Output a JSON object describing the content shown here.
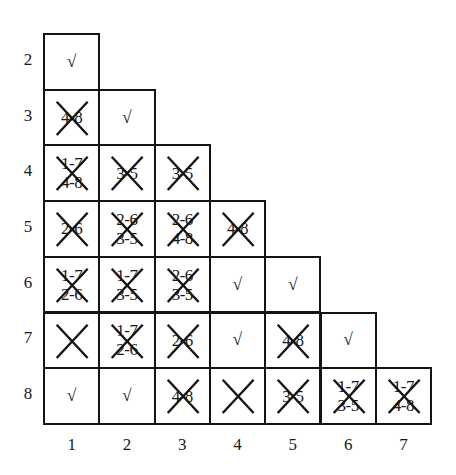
{
  "diagram": {
    "type": "implication-table",
    "row_labels": [
      "2",
      "3",
      "4",
      "5",
      "6",
      "7",
      "8"
    ],
    "col_labels": [
      "1",
      "2",
      "3",
      "4",
      "5",
      "6",
      "7"
    ],
    "rows": [
      {
        "row": "2",
        "cells": [
          {
            "col": "1",
            "mark": "check",
            "pairs": []
          }
        ]
      },
      {
        "row": "3",
        "cells": [
          {
            "col": "1",
            "mark": "crossed",
            "pairs": [
              "4-8"
            ]
          },
          {
            "col": "2",
            "mark": "check",
            "pairs": []
          }
        ]
      },
      {
        "row": "4",
        "cells": [
          {
            "col": "1",
            "mark": "crossed",
            "pairs": [
              "1-7",
              "4-8"
            ]
          },
          {
            "col": "2",
            "mark": "crossed",
            "pairs": [
              "3-5"
            ]
          },
          {
            "col": "3",
            "mark": "crossed",
            "pairs": [
              "3-5"
            ]
          }
        ]
      },
      {
        "row": "5",
        "cells": [
          {
            "col": "1",
            "mark": "crossed",
            "pairs": [
              "2-6"
            ]
          },
          {
            "col": "2",
            "mark": "crossed",
            "pairs": [
              "2-6",
              "3-5"
            ]
          },
          {
            "col": "3",
            "mark": "crossed",
            "pairs": [
              "2-6",
              "4-8"
            ]
          },
          {
            "col": "4",
            "mark": "crossed",
            "pairs": [
              "4-8"
            ]
          }
        ]
      },
      {
        "row": "6",
        "cells": [
          {
            "col": "1",
            "mark": "crossed",
            "pairs": [
              "1-7",
              "2-6"
            ]
          },
          {
            "col": "2",
            "mark": "crossed",
            "pairs": [
              "1-7",
              "3-5"
            ]
          },
          {
            "col": "3",
            "mark": "crossed",
            "pairs": [
              "2-6",
              "3-5"
            ]
          },
          {
            "col": "4",
            "mark": "check",
            "pairs": []
          },
          {
            "col": "5",
            "mark": "check",
            "pairs": []
          }
        ]
      },
      {
        "row": "7",
        "cells": [
          {
            "col": "1",
            "mark": "crossed",
            "pairs": []
          },
          {
            "col": "2",
            "mark": "crossed",
            "pairs": [
              "1-7",
              "2-6"
            ]
          },
          {
            "col": "3",
            "mark": "crossed",
            "pairs": [
              "2-6"
            ]
          },
          {
            "col": "4",
            "mark": "check",
            "pairs": []
          },
          {
            "col": "5",
            "mark": "crossed",
            "pairs": [
              "4-8"
            ]
          },
          {
            "col": "6",
            "mark": "check",
            "pairs": []
          }
        ]
      },
      {
        "row": "8",
        "cells": [
          {
            "col": "1",
            "mark": "check",
            "pairs": []
          },
          {
            "col": "2",
            "mark": "check",
            "pairs": []
          },
          {
            "col": "3",
            "mark": "crossed",
            "pairs": [
              "4-8"
            ]
          },
          {
            "col": "4",
            "mark": "crossed",
            "pairs": []
          },
          {
            "col": "5",
            "mark": "crossed",
            "pairs": [
              "3-5"
            ]
          },
          {
            "col": "6",
            "mark": "crossed",
            "pairs": [
              "1-7",
              "3-5"
            ]
          },
          {
            "col": "7",
            "mark": "crossed",
            "pairs": [
              "1-7",
              "4-8"
            ]
          }
        ]
      }
    ],
    "check_glyph": "√",
    "line_color": "#141414"
  }
}
